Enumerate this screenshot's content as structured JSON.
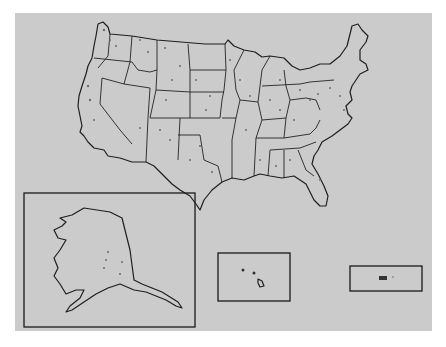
{
  "map": {
    "title": "",
    "type": "dot-density point map",
    "regions": [
      "Contiguous United States",
      "Alaska inset",
      "Hawaii inset",
      "Puerto Rico inset"
    ],
    "colors": {
      "background": "#cbcbcb",
      "outline": "#1e1e1e",
      "points": "#6c6c6c",
      "page": "#ffffff"
    },
    "insets": [
      {
        "name": "Alaska",
        "box": [
          24,
          193,
          195,
          297
        ]
      },
      {
        "name": "Hawaii",
        "box": [
          218,
          253,
          72,
          48
        ]
      },
      {
        "name": "Puerto Rico",
        "box": [
          350,
          266,
          72,
          25
        ]
      }
    ]
  }
}
